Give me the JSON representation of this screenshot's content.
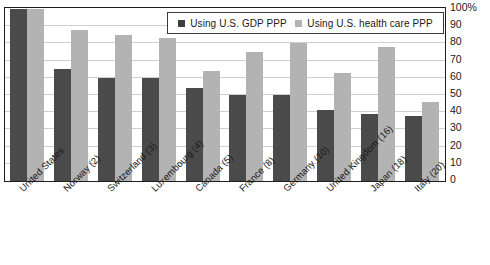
{
  "chart_data": {
    "type": "bar",
    "title": "",
    "subtitle": "",
    "xlabel": "",
    "ylabel": "",
    "ylim": [
      0,
      100
    ],
    "yticks": [
      "100%",
      "90",
      "80",
      "70",
      "60",
      "50",
      "40",
      "30",
      "20",
      "10",
      "0"
    ],
    "ytick_values": [
      100,
      90,
      80,
      70,
      60,
      50,
      40,
      30,
      20,
      10,
      0
    ],
    "grid": true,
    "legend_position": "top-right",
    "categories": [
      "United States",
      "Norway (2)",
      "Switzerland (3)",
      "Luxembourg (4)",
      "Canada (5)",
      "France (8)",
      "Germany (10)",
      "United Kingdom (16)",
      "Japan (18)",
      "Italy (20)"
    ],
    "series": [
      {
        "name": "Using U.S. GDP PPP",
        "color": "#4a4a4a",
        "values": [
          100,
          65,
          60,
          60,
          54,
          50,
          50,
          41,
          39,
          38
        ]
      },
      {
        "name": "Using U.S. health care PPP",
        "color": "#b3b3b3",
        "values": [
          100,
          88,
          85,
          83,
          64,
          75,
          80,
          63,
          78,
          46
        ]
      }
    ]
  },
  "legend": {
    "entries": [
      {
        "label": "Using U.S. GDP PPP",
        "swatch": "legend-swatch-dark"
      },
      {
        "label": "Using U.S. health care PPP",
        "swatch": "legend-swatch-light"
      }
    ]
  },
  "colors": {
    "series_dark": "#4a4a4a",
    "series_light": "#b3b3b3",
    "frame": "#1d1d1d",
    "gridline": "#cfcfcf",
    "text": "#1a1a1a",
    "background": "#ffffff"
  }
}
